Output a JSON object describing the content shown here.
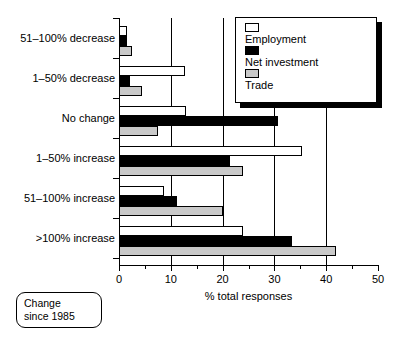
{
  "chart_data": {
    "type": "bar",
    "orientation": "horizontal",
    "title": "",
    "xlabel": "% total responses",
    "ylabel": "",
    "xlim": [
      0,
      50
    ],
    "xticks": [
      0,
      10,
      20,
      30,
      40,
      50
    ],
    "xtick_labels": [
      "0",
      "10",
      "20",
      "30",
      "40",
      "50"
    ],
    "minor_xticks": [
      5,
      15,
      25,
      35,
      45
    ],
    "grid": "vertical gridlines at 10, 20, 30, 40",
    "legend_position": "top-right",
    "categories": [
      "51–100% decrease",
      "1–50% decrease",
      "No change",
      "1–50% increase",
      "51–100% increase",
      ">100% increase"
    ],
    "series": [
      {
        "name": "Employment",
        "color": "#ffffff",
        "values": [
          1.5,
          12.8,
          13.0,
          35.4,
          8.6,
          23.9
        ]
      },
      {
        "name": "Net investment",
        "color": "#000000",
        "values": [
          1.6,
          2.1,
          30.6,
          21.4,
          11.2,
          33.4
        ]
      },
      {
        "name": "Trade",
        "color": "#c9c9c9",
        "values": [
          2.5,
          4.5,
          7.6,
          24.0,
          20.0,
          41.8
        ]
      }
    ],
    "annotation": {
      "lines": [
        "Change",
        "since 1985"
      ]
    }
  },
  "legend": {
    "entries": [
      {
        "label": "Employment"
      },
      {
        "label": "Net investment"
      },
      {
        "label": "Trade"
      }
    ]
  }
}
